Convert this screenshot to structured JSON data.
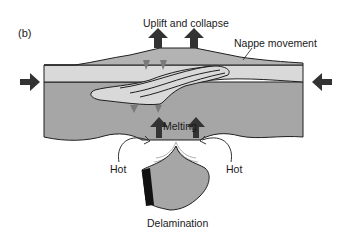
{
  "figure": {
    "panel_label": "(b)",
    "labels": {
      "uplift": "Uplift and collapse",
      "nappe": "Nappe movement",
      "melting": "Melting",
      "hot_left": "Hot",
      "hot_right": "Hot",
      "delamination": "Delamination"
    },
    "colors": {
      "upper_crust": "#d9d9d9",
      "lower_crust": "#a6a6a6",
      "wedge": "#b3b3b3",
      "arrow": "#333333",
      "outline": "#1f1f1f",
      "slab_edge": "#111111"
    }
  }
}
